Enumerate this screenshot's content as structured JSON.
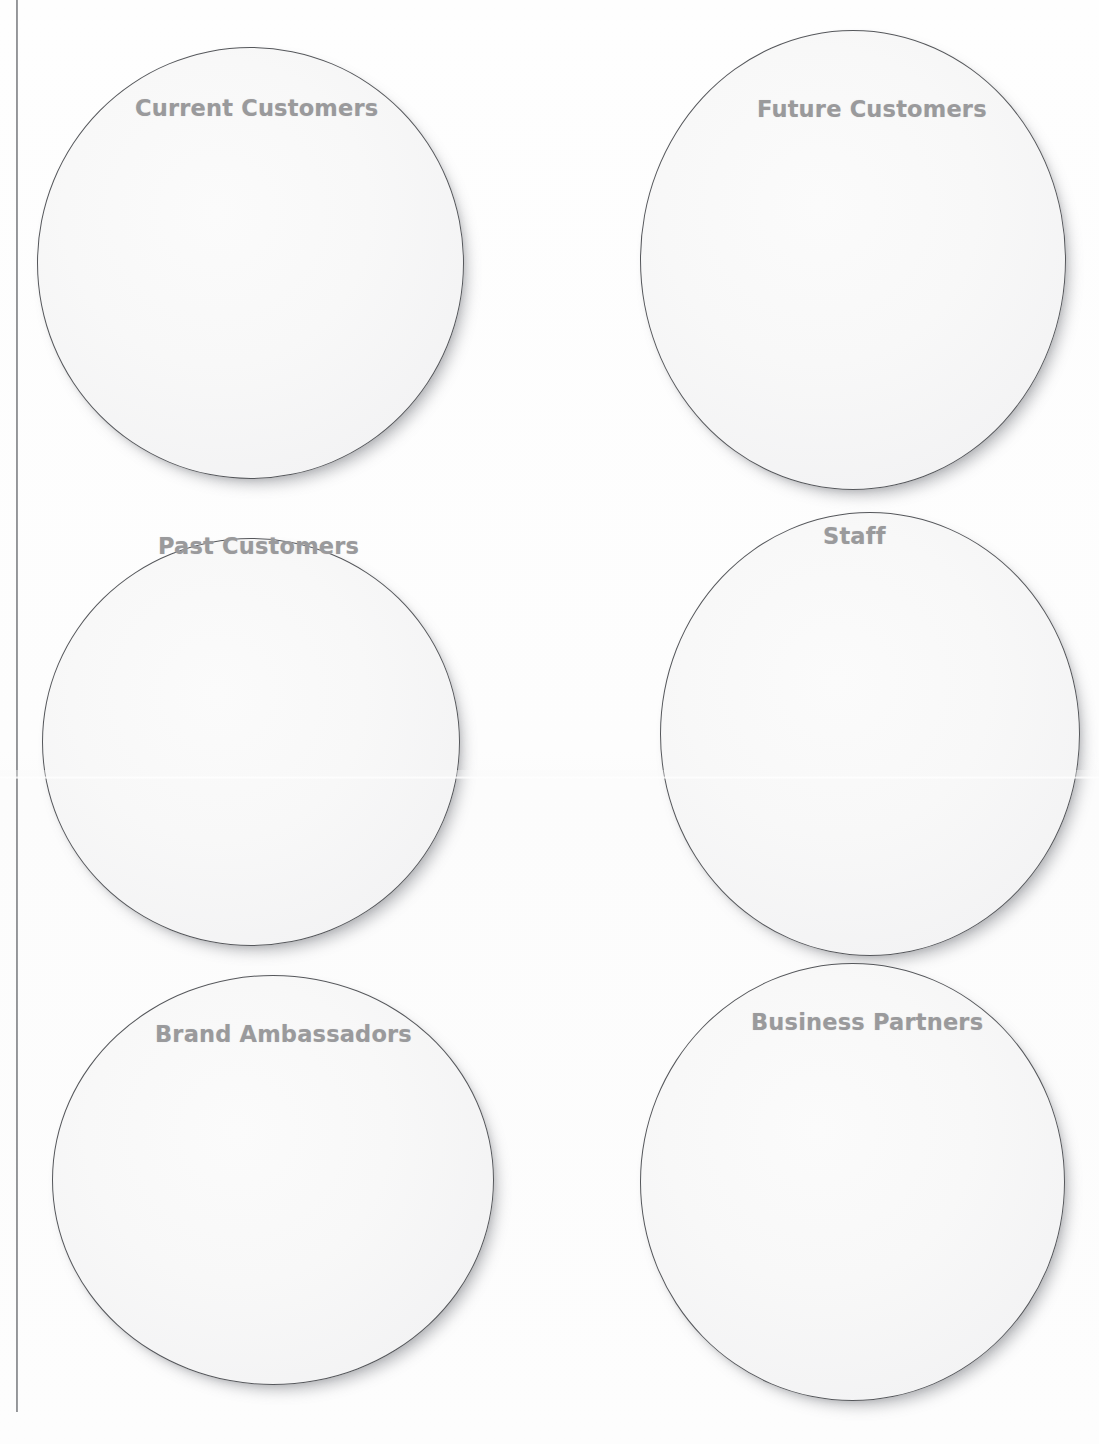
{
  "page": {
    "background_color": "#fdfdfd",
    "width": 1099,
    "height": 1444
  },
  "margin_rule": {
    "color": "#6a6c70"
  },
  "worksheet": {
    "shape": "circle",
    "shape_fill_color": "#f7f7f8",
    "shape_border_color": "#55575b",
    "label_color": "#9a9a9c",
    "circles": [
      {
        "label": "Current Customers",
        "row": 1,
        "column": "left"
      },
      {
        "label": "Future Customers",
        "row": 1,
        "column": "right"
      },
      {
        "label": "Past Customers",
        "row": 2,
        "column": "left"
      },
      {
        "label": "Staff",
        "row": 2,
        "column": "right"
      },
      {
        "label": "Brand Ambassadors",
        "row": 3,
        "column": "left"
      },
      {
        "label": "Business Partners",
        "row": 3,
        "column": "right"
      }
    ]
  }
}
